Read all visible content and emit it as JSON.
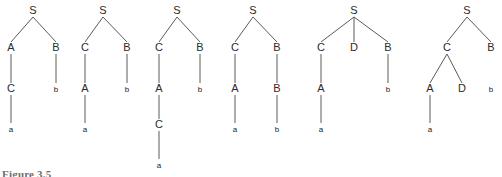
{
  "figure": {
    "caption": "Figure 3.5",
    "node_font_size": 11,
    "terminal_font_size": 8,
    "edge_color": "#5a5a5a",
    "label_color": "#2b2b2b",
    "background": "#ffffff",
    "width": 502,
    "height": 177
  },
  "chart_data": {
    "type": "diagram",
    "diagram_type": "parse-tree-sequence",
    "title": "Figure 3.5",
    "tree_count": 6,
    "symbols": [
      "S",
      "A",
      "B",
      "C",
      "D",
      "a",
      "b"
    ],
    "nonterminals": [
      "S",
      "A",
      "B",
      "C",
      "D"
    ],
    "terminals": [
      "a",
      "b"
    ],
    "trees": [
      {
        "index": 1,
        "root": "S",
        "depth": 4,
        "yield": "a b",
        "productions": [
          "S -> A B",
          "A -> C",
          "C -> a",
          "B -> b"
        ],
        "nodes": [
          {
            "id": "n1",
            "label": "S",
            "x": 33,
            "y": 14,
            "level": 0
          },
          {
            "id": "n2",
            "label": "A",
            "x": 11,
            "y": 51,
            "level": 1
          },
          {
            "id": "n3",
            "label": "B",
            "x": 56,
            "y": 51,
            "level": 1
          },
          {
            "id": "n4",
            "label": "C",
            "x": 11,
            "y": 92,
            "level": 2
          },
          {
            "id": "n5",
            "label": "b",
            "x": 56,
            "y": 92,
            "level": 2
          },
          {
            "id": "n6",
            "label": "a",
            "x": 11,
            "y": 132,
            "level": 3
          }
        ],
        "edges": [
          {
            "from": "n1",
            "to": "n2"
          },
          {
            "from": "n1",
            "to": "n3"
          },
          {
            "from": "n2",
            "to": "n4"
          },
          {
            "from": "n3",
            "to": "n5"
          },
          {
            "from": "n4",
            "to": "n6"
          }
        ]
      },
      {
        "index": 2,
        "root": "S",
        "depth": 4,
        "yield": "a b",
        "productions": [
          "S -> C B",
          "C -> A",
          "A -> a",
          "B -> b"
        ],
        "nodes": [
          {
            "id": "n1",
            "label": "S",
            "x": 103,
            "y": 14,
            "level": 0
          },
          {
            "id": "n2",
            "label": "C",
            "x": 85,
            "y": 51,
            "level": 1
          },
          {
            "id": "n3",
            "label": "B",
            "x": 127,
            "y": 51,
            "level": 1
          },
          {
            "id": "n4",
            "label": "A",
            "x": 85,
            "y": 92,
            "level": 2
          },
          {
            "id": "n5",
            "label": "b",
            "x": 127,
            "y": 92,
            "level": 2
          },
          {
            "id": "n6",
            "label": "a",
            "x": 85,
            "y": 132,
            "level": 3
          }
        ],
        "edges": [
          {
            "from": "n1",
            "to": "n2"
          },
          {
            "from": "n1",
            "to": "n3"
          },
          {
            "from": "n2",
            "to": "n4"
          },
          {
            "from": "n3",
            "to": "n5"
          },
          {
            "from": "n4",
            "to": "n6"
          }
        ]
      },
      {
        "index": 3,
        "root": "S",
        "depth": 5,
        "yield": "a b",
        "productions": [
          "S -> C B",
          "C -> A",
          "A -> C",
          "C -> a",
          "B -> b"
        ],
        "nodes": [
          {
            "id": "n1",
            "label": "S",
            "x": 177,
            "y": 14,
            "level": 0
          },
          {
            "id": "n2",
            "label": "C",
            "x": 159,
            "y": 51,
            "level": 1
          },
          {
            "id": "n3",
            "label": "B",
            "x": 200,
            "y": 51,
            "level": 1
          },
          {
            "id": "n4",
            "label": "A",
            "x": 159,
            "y": 92,
            "level": 2
          },
          {
            "id": "n5",
            "label": "b",
            "x": 200,
            "y": 92,
            "level": 2
          },
          {
            "id": "n6",
            "label": "C",
            "x": 159,
            "y": 128,
            "level": 3
          },
          {
            "id": "n7",
            "label": "a",
            "x": 159,
            "y": 168,
            "level": 4
          }
        ],
        "edges": [
          {
            "from": "n1",
            "to": "n2"
          },
          {
            "from": "n1",
            "to": "n3"
          },
          {
            "from": "n2",
            "to": "n4"
          },
          {
            "from": "n3",
            "to": "n5"
          },
          {
            "from": "n4",
            "to": "n6"
          },
          {
            "from": "n6",
            "to": "n7"
          }
        ]
      },
      {
        "index": 4,
        "root": "S",
        "depth": 4,
        "yield": "a b",
        "productions": [
          "S -> C B",
          "C -> A",
          "A -> a",
          "B -> B",
          "B -> b"
        ],
        "nodes": [
          {
            "id": "n1",
            "label": "S",
            "x": 253,
            "y": 14,
            "level": 0
          },
          {
            "id": "n2",
            "label": "C",
            "x": 235,
            "y": 51,
            "level": 1
          },
          {
            "id": "n3",
            "label": "B",
            "x": 277,
            "y": 51,
            "level": 1
          },
          {
            "id": "n4",
            "label": "A",
            "x": 235,
            "y": 92,
            "level": 2
          },
          {
            "id": "n5",
            "label": "B",
            "x": 277,
            "y": 92,
            "level": 2
          },
          {
            "id": "n6",
            "label": "a",
            "x": 235,
            "y": 132,
            "level": 3
          },
          {
            "id": "n7",
            "label": "b",
            "x": 277,
            "y": 132,
            "level": 3
          }
        ],
        "edges": [
          {
            "from": "n1",
            "to": "n2"
          },
          {
            "from": "n1",
            "to": "n3"
          },
          {
            "from": "n2",
            "to": "n4"
          },
          {
            "from": "n3",
            "to": "n5"
          },
          {
            "from": "n4",
            "to": "n6"
          },
          {
            "from": "n5",
            "to": "n7"
          }
        ]
      },
      {
        "index": 5,
        "root": "S",
        "depth": 4,
        "yield": "a b",
        "productions": [
          "S -> C D B",
          "C -> A",
          "A -> a",
          "B -> b"
        ],
        "nodes": [
          {
            "id": "n1",
            "label": "S",
            "x": 354,
            "y": 14,
            "level": 0
          },
          {
            "id": "n2",
            "label": "C",
            "x": 321,
            "y": 51,
            "level": 1
          },
          {
            "id": "n3",
            "label": "D",
            "x": 354,
            "y": 51,
            "level": 1
          },
          {
            "id": "n4",
            "label": "B",
            "x": 388,
            "y": 51,
            "level": 1
          },
          {
            "id": "n5",
            "label": "A",
            "x": 321,
            "y": 92,
            "level": 2
          },
          {
            "id": "n6",
            "label": "b",
            "x": 388,
            "y": 92,
            "level": 2
          },
          {
            "id": "n7",
            "label": "a",
            "x": 321,
            "y": 132,
            "level": 3
          }
        ],
        "edges": [
          {
            "from": "n1",
            "to": "n2"
          },
          {
            "from": "n1",
            "to": "n3"
          },
          {
            "from": "n1",
            "to": "n4"
          },
          {
            "from": "n2",
            "to": "n5"
          },
          {
            "from": "n4",
            "to": "n6"
          },
          {
            "from": "n5",
            "to": "n7"
          }
        ]
      },
      {
        "index": 6,
        "root": "S",
        "depth": 4,
        "yield": "a b",
        "productions": [
          "S -> C B",
          "C -> A D",
          "A -> a",
          "B -> b"
        ],
        "nodes": [
          {
            "id": "n1",
            "label": "S",
            "x": 467,
            "y": 14,
            "level": 0
          },
          {
            "id": "n2",
            "label": "C",
            "x": 447,
            "y": 51,
            "level": 1
          },
          {
            "id": "n3",
            "label": "B",
            "x": 491,
            "y": 51,
            "level": 1
          },
          {
            "id": "n4",
            "label": "A",
            "x": 430,
            "y": 92,
            "level": 2
          },
          {
            "id": "n5",
            "label": "D",
            "x": 462,
            "y": 92,
            "level": 2
          },
          {
            "id": "n6",
            "label": "b",
            "x": 491,
            "y": 92,
            "level": 2
          },
          {
            "id": "n7",
            "label": "a",
            "x": 430,
            "y": 132,
            "level": 3
          }
        ],
        "edges": [
          {
            "from": "n1",
            "to": "n2"
          },
          {
            "from": "n1",
            "to": "n3"
          },
          {
            "from": "n2",
            "to": "n4"
          },
          {
            "from": "n2",
            "to": "n5"
          },
          {
            "from": "n4",
            "to": "n7"
          }
        ]
      }
    ]
  }
}
